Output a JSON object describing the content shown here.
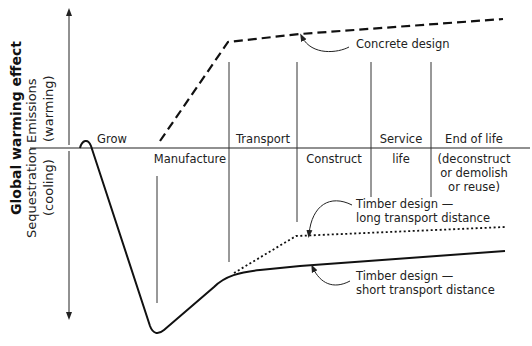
{
  "y_axis": {
    "title": "Global warming effect",
    "upper_label_line1": "Emissions",
    "upper_label_line2": "(warming)",
    "lower_label_line1": "Sequestration",
    "lower_label_line2": "(cooling)"
  },
  "phases": {
    "grow": "Grow",
    "manufacture": "Manufacture",
    "transport": "Transport",
    "construct": "Construct",
    "service_line1": "Service",
    "service_line2": "life",
    "end_line1": "End of life",
    "end_line2": "(deconstruct",
    "end_line3": "or demolish",
    "end_line4": "or reuse)"
  },
  "annotations": {
    "concrete": "Concrete design",
    "timber_long_line1": "Timber design —",
    "timber_long_line2": "long transport distance",
    "timber_short_line1": "Timber design —",
    "timber_short_line2": "short transport distance"
  },
  "colors": {
    "line": "#111111",
    "divider": "#333333",
    "background": "#ffffff"
  }
}
